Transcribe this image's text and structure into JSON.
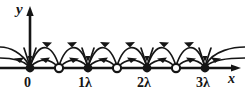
{
  "figure": {
    "background_color": "#ffffff",
    "ink_color": "#151515",
    "axes": {
      "x_axis_label": "x",
      "y_axis_label": "y",
      "x_axis_y_px": 68,
      "y_axis_x_px": 30,
      "x_axis_start_px": 0,
      "x_axis_end_px": 241,
      "y_axis_top_px": 8
    },
    "tick_labels": [
      {
        "text": "0",
        "x_px": 30
      },
      {
        "text": "1λ",
        "x_px": 88
      },
      {
        "text": "2λ",
        "x_px": 147
      },
      {
        "text": "3λ",
        "x_px": 205
      }
    ],
    "markers": [
      {
        "type": "filled",
        "x_px": 30,
        "label": "0",
        "role": "sink"
      },
      {
        "type": "open",
        "x_px": 59,
        "label": "0.5λ",
        "role": "source"
      },
      {
        "type": "filled",
        "x_px": 88,
        "label": "1λ",
        "role": "sink"
      },
      {
        "type": "open",
        "x_px": 117,
        "label": "1.5λ",
        "role": "source"
      },
      {
        "type": "filled",
        "x_px": 147,
        "label": "2λ",
        "role": "sink"
      },
      {
        "type": "open",
        "x_px": 176,
        "label": "2.5λ",
        "role": "source"
      },
      {
        "type": "filled",
        "x_px": 205,
        "label": "3λ",
        "role": "sink"
      }
    ],
    "field_lines": {
      "description": "Field lines arc from each open circle to the adjacent filled dots on both sides; arrowheads point inward toward the filled dots.",
      "arc_tiers": [
        {
          "name": "tall-arc",
          "peak_y_px": 41
        },
        {
          "name": "low-arc",
          "peak_y_px": 58
        }
      ],
      "arrow_direction": "toward-filled-dot"
    }
  }
}
